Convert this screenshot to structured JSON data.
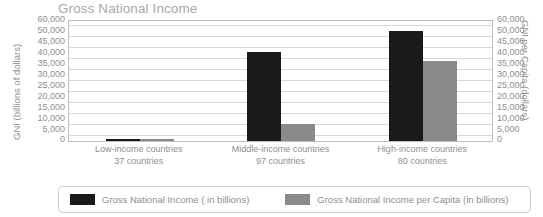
{
  "chart_data": {
    "type": "bar",
    "title": "Gross National Income",
    "xlabel": "",
    "ylabel": "GNI (billions of dollars)",
    "y2label": "GNI per Capita (dollars)",
    "grid": true,
    "legend_position": "bottom",
    "ylim": [
      0,
      60000
    ],
    "ytick_labels": [
      "60,000",
      "50,000",
      "45,000",
      "40,000",
      "35,000",
      "30,000",
      "25,000",
      "20,000",
      "15,000",
      "10,000",
      "5,000",
      "0"
    ],
    "ytick_values": [
      60000,
      50000,
      45000,
      40000,
      35000,
      30000,
      25000,
      20000,
      15000,
      10000,
      5000,
      0
    ],
    "y2tick_labels": [
      "60,000",
      "50,000",
      "45,000",
      "40,000",
      "35,000",
      "30,000",
      "25,000",
      "20,000",
      "15,000",
      "10,000",
      "5,000",
      "0"
    ],
    "categories": [
      "Low-income countries",
      "Middle-income countries",
      "High-income countries"
    ],
    "category_sublabels": [
      "37 countries",
      "97 countries",
      "80 countries"
    ],
    "series": [
      {
        "name": "Gross National Income ( in billions)",
        "color": "#1a1a1a",
        "values": [
          400,
          44500,
          55000
        ]
      },
      {
        "name": "Gross National Income per Capita (in billions)",
        "color": "#8a8a8a",
        "values": [
          200,
          8400,
          40000
        ]
      }
    ]
  },
  "axes": {
    "left_title": "GNI (billions of dollars)",
    "right_title": "GNI per Capita (dollars)"
  },
  "legend": {
    "items": [
      {
        "label": "Gross National Income ( in billions)",
        "color": "#1a1a1a"
      },
      {
        "label": "Gross National Income per Capita (in billions)",
        "color": "#8a8a8a"
      }
    ]
  },
  "colors": {
    "series_dark": "#1a1a1a",
    "series_grey": "#8a8a8a",
    "grid": "#d8d8d8",
    "frame": "#bdbdbd",
    "text": "#8f8f8f",
    "title": "#a8a8a8"
  }
}
